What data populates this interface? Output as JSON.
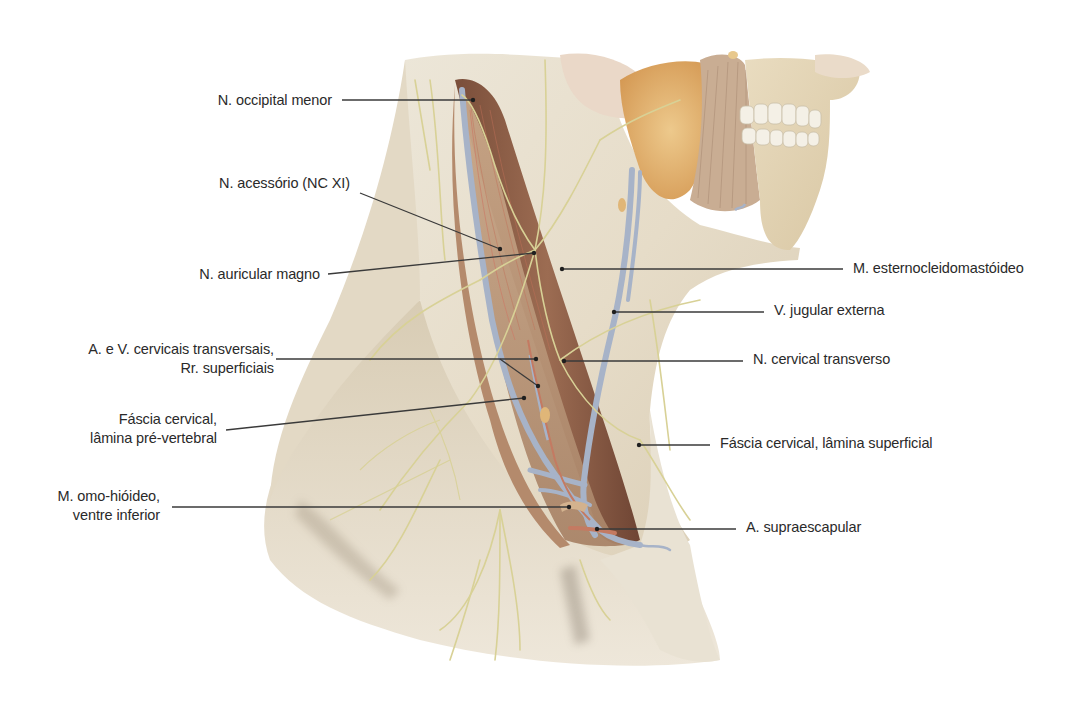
{
  "figure": {
    "colors": {
      "background": "#ffffff",
      "skin_fascia": "#e8e0cf",
      "skin_shadow": "#b8ac96",
      "muscle": "#9a6a50",
      "muscle_dark": "#6e4634",
      "vein": "#a9b4c8",
      "artery": "#c47a62",
      "nerve": "#d9d39a",
      "gland": "#e2b474",
      "tooth": "#f3efe6",
      "leader_line": "#3a3a3a",
      "label_text": "#2a2a2a"
    }
  },
  "labels": {
    "left": [
      {
        "id": "n-occipital-menor",
        "lines": [
          "N. occipital menor"
        ]
      },
      {
        "id": "n-acessorio",
        "lines": [
          "N. acessório (NC XI)"
        ]
      },
      {
        "id": "n-auricular-magno",
        "lines": [
          "N. auricular magno"
        ]
      },
      {
        "id": "a-v-cervicais-transversais",
        "lines": [
          "A. e V. cervicais transversais,",
          "Rr. superficiais"
        ]
      },
      {
        "id": "fascia-cervical-pre-vertebral",
        "lines": [
          "Fáscia cervical,",
          "lâmina pré-vertebral"
        ]
      },
      {
        "id": "m-omo-hioideo",
        "lines": [
          "M. omo-hióideo,",
          "ventre inferior"
        ]
      }
    ],
    "right": [
      {
        "id": "m-esternocleidomastoideo",
        "lines": [
          "M. esternocleidomastóideo"
        ]
      },
      {
        "id": "v-jugular-externa",
        "lines": [
          "V. jugular externa"
        ]
      },
      {
        "id": "n-cervical-transverso",
        "lines": [
          "N. cervical transverso"
        ]
      },
      {
        "id": "fascia-cervical-superficial",
        "lines": [
          "Fáscia cervical, lâmina superficial"
        ]
      },
      {
        "id": "a-supraescapular",
        "lines": [
          "A. supraescapular"
        ]
      }
    ]
  }
}
